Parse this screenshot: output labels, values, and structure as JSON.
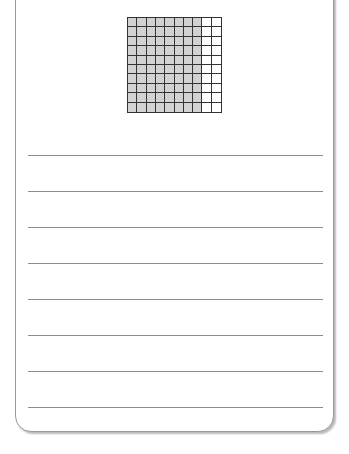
{
  "worksheet": {
    "hundred_grid": {
      "rows": 10,
      "columns": 10,
      "shaded_columns": 8,
      "shaded_count": 80,
      "total_cells": 100,
      "shaded_color": "#d2d2d2",
      "line_color": "#333333"
    },
    "writing_lines": {
      "count": 8,
      "line_color": "#8c8c8c"
    }
  }
}
